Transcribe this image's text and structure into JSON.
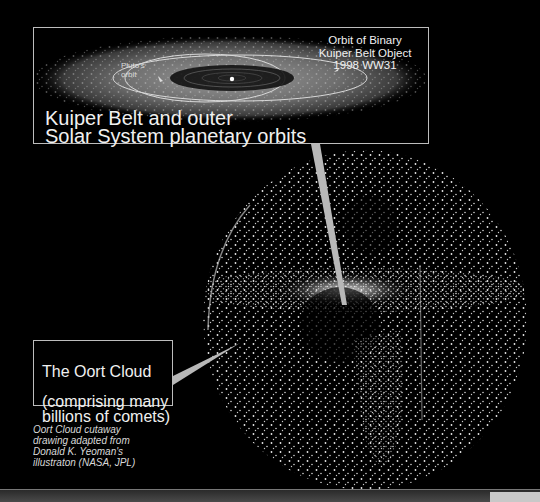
{
  "inset": {
    "title": "Kuiper Belt and outer\nSolar System planetary orbits",
    "binary_object_label": "Orbit of Binary\nKuiper Belt Object\n1998 WW31",
    "pluto_label": "Pluto's\norbit"
  },
  "oort": {
    "title": "The Oort Cloud",
    "subtitle": "(comprising many\nbillions of comets)"
  },
  "credit": "Oort Cloud cutaway\ndrawing adapted from\nDonald K. Yeoman's\nillustraton (NASA, JPL)",
  "colors": {
    "background": "#000000",
    "label_border": "#bdbdbd",
    "pointer": "#b8b8b8",
    "text": "#f0f0f0"
  }
}
